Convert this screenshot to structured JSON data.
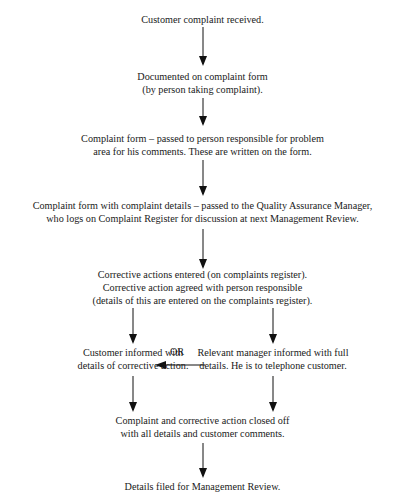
{
  "heading_cut": "...",
  "flowchart": {
    "steps": [
      {
        "id": "received",
        "lines": [
          "Customer complaint received."
        ]
      },
      {
        "id": "documented",
        "lines": [
          "Documented on complaint form",
          "(by person taking complaint)."
        ]
      },
      {
        "id": "passed",
        "lines": [
          "Complaint form – passed to person responsible for problem",
          "area for his comments. These are written on the form."
        ]
      },
      {
        "id": "qa",
        "lines": [
          "Complaint form with complaint details – passed to the Quality Assurance Manager,",
          "who logs on Complaint Register for discussion at next Management Review."
        ]
      },
      {
        "id": "corrective",
        "lines": [
          "Corrective actions entered (on complaints register).",
          "Corrective action agreed with person responsible",
          "(details of this are entered on the complaints register)."
        ]
      },
      {
        "id": "customer_informed",
        "lines": [
          "Customer informed with",
          "details of corrective action."
        ]
      },
      {
        "id": "manager_informed",
        "lines": [
          "Relevant manager informed with full",
          "details. He is to telephone customer."
        ]
      },
      {
        "id": "closed",
        "lines": [
          "Complaint and corrective action closed off",
          "with all details and customer comments."
        ]
      },
      {
        "id": "filed",
        "lines": [
          "Details filed for Management Review."
        ]
      }
    ],
    "or_label": "OR"
  }
}
